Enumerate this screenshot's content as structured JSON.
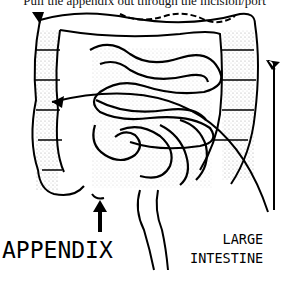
{
  "caption": "Pull the appendix out through the incision/port",
  "labels": {
    "appendix": "APPENDIX",
    "large_intestine_line1": "LARGE",
    "large_intestine_line2": "INTESTINE"
  },
  "figure": {
    "style": "black-and-white stippled line drawing",
    "colors": {
      "ink": "#000000",
      "background": "#ffffff"
    }
  }
}
